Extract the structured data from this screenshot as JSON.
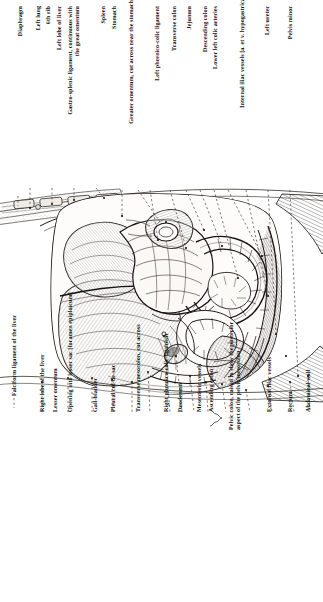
{
  "plate": {
    "orientation": "labels rotated 90 degrees, reading bottom-to-top",
    "background_color": "#ffffff",
    "ink_color": "#15120f",
    "subject": "Abdominal cavity dissection, viewed from the front with the anterior abdominal wall reflected"
  },
  "labels_top": [
    {
      "text": "Diaphragm"
    },
    {
      "text": "Left lung"
    },
    {
      "text": "6th rib"
    },
    {
      "text": "Left lobe of liver"
    },
    {
      "text": "Gastro-splenic ligament, continuous with\nthe great omentum"
    },
    {
      "text": "Spleen"
    },
    {
      "text": "Stomach"
    },
    {
      "text": "Greater omentum, cut across near the stomach"
    },
    {
      "text": "Left phrenico-colic ligament"
    },
    {
      "text": "Transverse colon"
    },
    {
      "text": "Jejunum"
    },
    {
      "text": "Descending colon"
    },
    {
      "text": "Lower left colic arteries"
    },
    {
      "text": "Internal iliac vessels [a. et v. hypogastrica]"
    },
    {
      "text": "Left ureter"
    },
    {
      "text": "Pelvis minor"
    }
  ],
  "labels_bottom": [
    {
      "text": "Falciform ligament of the liver"
    },
    {
      "text": "Right lobe of the liver"
    },
    {
      "text": "Lesser omentum"
    },
    {
      "text": "Opening into lesser sac [foramen epiploicum]"
    },
    {
      "text": "Gall-bladder"
    },
    {
      "text": "Pleural cul-de-sac"
    },
    {
      "text": "Transverse mesocolon, cut across"
    },
    {
      "text": "Right phrenico-colic ligament"
    },
    {
      "text": "Duodenum"
    },
    {
      "text": "Mesenteric vessels"
    },
    {
      "text": "Ascending colon"
    },
    {
      "text": "Pelvic colon, raised to show the posterior\naspect of the pelvic mesocolon"
    },
    {
      "text": "External iliac vessels"
    },
    {
      "text": "Rectum"
    },
    {
      "text": "Abdominal wall"
    }
  ]
}
